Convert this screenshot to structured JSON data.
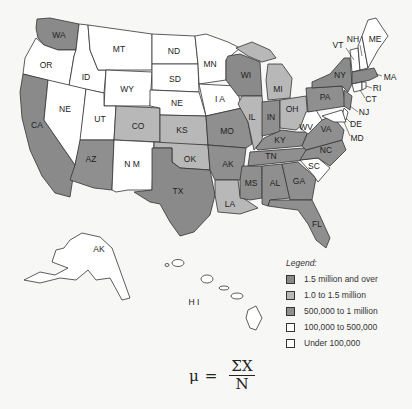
{
  "colors": {
    "c1_5m_plus": "#8a8a8a",
    "c1_0_1_5m": "#b8b8b8",
    "c500k_1m": "#8f8f8f",
    "c100k_500k": "#ffffff",
    "under_100k": "#ffffff",
    "stroke": "#333333"
  },
  "states": {
    "WA": "WA",
    "OR": "OR",
    "CA": "CA",
    "ID": "ID",
    "NV": "NE",
    "MT": "MT",
    "WY": "WY",
    "UT": "UT",
    "AZ": "AZ",
    "CO": "CO",
    "NM": "N M",
    "ND": "ND",
    "SD": "SD",
    "NE": "NE",
    "KS": "KS",
    "OK": "OK",
    "TX": "TX",
    "MN": "MN",
    "IA": "I A",
    "MO": "MO",
    "AR": "AK",
    "LA": "LA",
    "WI": "WI",
    "IL": "IL",
    "MI": "MI",
    "IN": "IN",
    "OH": "OH",
    "KY": "KY",
    "TN": "TN",
    "MS": "MS",
    "AL": "AL",
    "GA": "GA",
    "FL": "FL",
    "SC": "SC",
    "NC": "NC",
    "VA": "VA",
    "WV": "WV",
    "PA": "PA",
    "NY": "NY",
    "VT": "VT",
    "NH": "NH",
    "ME": "ME",
    "MA": "MA",
    "RI": "RI",
    "CT": "CT",
    "NJ": "NJ",
    "DE": "DE",
    "MD": "MD",
    "AK": "AK",
    "HI": "H I"
  },
  "legend": {
    "title": "Legend:",
    "items": [
      {
        "label": "1.5 million and over",
        "color": "#8a8a8a"
      },
      {
        "label": "1.0 to 1.5 million",
        "color": "#b8b8b8"
      },
      {
        "label": "500,000 to 1 million",
        "color": "#8f8f8f"
      },
      {
        "label": "100,000 to 500,000",
        "color": "#ffffff"
      },
      {
        "label": "Under 100,000",
        "color": "#ffffff"
      }
    ]
  },
  "formula": {
    "lhs": "μ",
    "eq": "=",
    "numerator": "ΣX",
    "denominator": "N"
  }
}
